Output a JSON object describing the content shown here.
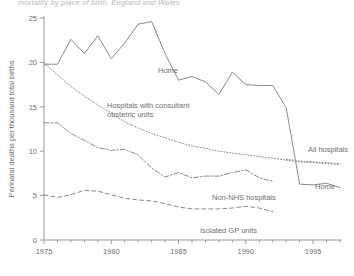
{
  "figure": {
    "title_clipped": "mortality by place of birth, England and Wales",
    "ylabel": "Perinatal deaths per thousand total births",
    "xlabel": ""
  },
  "axes": {
    "y_ticks": [
      "0",
      "5",
      "10",
      "15",
      "20",
      "25"
    ],
    "x_ticks_labeled": [
      "1975",
      "1980",
      "1985",
      "1990",
      "1995"
    ],
    "xlim": [
      1975,
      1997
    ],
    "ylim": [
      0,
      25
    ]
  },
  "series_labels": {
    "home_top": "Home",
    "hospitals_consultant": "Hospitals with consultant\nobstetric units",
    "hospitals_consultant_line1": "Hospitals with consultant",
    "hospitals_consultant_line2": "obstetric units",
    "non_nhs": "Non-NHS hospitals",
    "isolated_gp": "Isolated GP units",
    "all_hospitals": "All hospitals",
    "home_right": "Home"
  },
  "chart_data": {
    "type": "line",
    "title": "mortality by place of birth, England and Wales",
    "xlabel": "",
    "ylabel": "Perinatal deaths per thousand total births",
    "xlim": [
      1975,
      1997
    ],
    "ylim": [
      0,
      25
    ],
    "grid": false,
    "legend": "inline-annotations",
    "x": [
      1975,
      1976,
      1977,
      1978,
      1979,
      1980,
      1981,
      1982,
      1983,
      1984,
      1985,
      1986,
      1987,
      1988,
      1989,
      1990,
      1991,
      1992,
      1993,
      1994,
      1995,
      1996,
      1997
    ],
    "series": [
      {
        "name": "Home",
        "style": "solid",
        "values": [
          19.8,
          19.8,
          22.6,
          21.0,
          23.0,
          20.4,
          22.2,
          24.3,
          24.6,
          21.0,
          18.0,
          18.4,
          17.8,
          16.4,
          18.9,
          17.5,
          17.4,
          17.4,
          14.9,
          6.3,
          6.2,
          6.4,
          5.9
        ]
      },
      {
        "name": "Hospitals with consultant obstetric units",
        "style": "dotted",
        "values": [
          19.9,
          18.6,
          17.3,
          16.2,
          15.2,
          14.3,
          13.3,
          12.6,
          12.0,
          11.5,
          11.0,
          10.6,
          10.3,
          10.0,
          9.8,
          9.6,
          9.4,
          9.2,
          9.0,
          8.8,
          8.7,
          8.6,
          8.5
        ]
      },
      {
        "name": "All hospitals",
        "style": "dotted",
        "values": [
          null,
          null,
          null,
          null,
          null,
          null,
          null,
          null,
          null,
          null,
          null,
          null,
          null,
          null,
          null,
          null,
          null,
          null,
          9.1,
          8.9,
          8.8,
          8.7,
          8.6
        ]
      },
      {
        "name": "Non-NHS hospitals",
        "style": "dashdot",
        "values": [
          13.2,
          13.2,
          12.0,
          11.2,
          10.4,
          10.1,
          10.2,
          9.6,
          8.1,
          7.1,
          7.6,
          7.0,
          7.2,
          7.2,
          7.6,
          7.9,
          7.0,
          6.6,
          null,
          null,
          null,
          null,
          null
        ]
      },
      {
        "name": "Isolated GP units",
        "style": "dashed",
        "values": [
          5.1,
          4.8,
          5.1,
          5.6,
          5.5,
          5.1,
          4.7,
          4.5,
          4.4,
          4.1,
          3.7,
          3.5,
          3.5,
          3.5,
          3.6,
          3.8,
          3.6,
          3.2,
          null,
          null,
          null,
          null,
          null
        ]
      }
    ]
  }
}
